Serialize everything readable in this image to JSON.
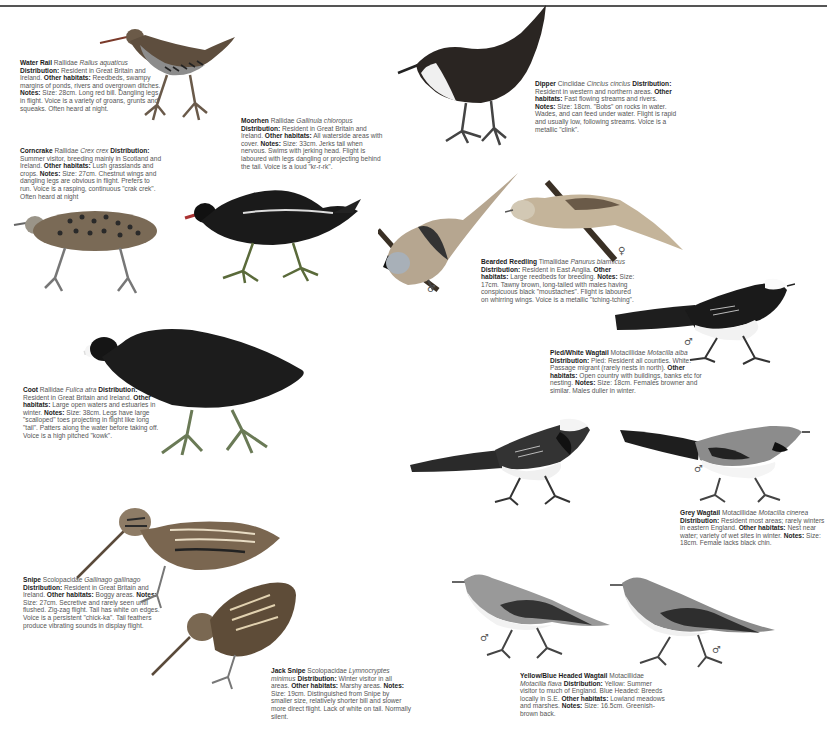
{
  "page": {
    "type": "field-guide-page",
    "topic": "Waterside birds"
  },
  "entries": [
    {
      "id": "water-rail",
      "name": "Water Rail",
      "family": "Rallidae",
      "latin": "Rallus aquaticus",
      "distribution": "Resident in Great Britain and Ireland.",
      "other_habitats": "Reedbeds, swampy margins of ponds, rivers and overgrown ditches.",
      "notes": "Size: 28cm. Long red bill. Dangling legs in flight. Voice is a variety of groans, grunts and squeaks. Often heard at night."
    },
    {
      "id": "corncrake",
      "name": "Corncrake",
      "family": "Rallidae",
      "latin": "Crex crex",
      "distribution": "Summer visitor, breeding mainly in Scotland and Ireland.",
      "other_habitats": "Lush grasslands and crops.",
      "notes": "Size: 27cm. Chestnut wings and dangling legs are obvious in flight. Prefers to run. Voice is a rasping, continuous \"crak crek\". Often heard at night"
    },
    {
      "id": "moorhen",
      "name": "Moorhen",
      "family": "Rallidae",
      "latin": "Gallinula chloropus",
      "distribution": "Resident in Great Britain and Ireland.",
      "other_habitats": "All waterside areas with cover.",
      "notes": "Size: 33cm. Jerks tail when nervous. Swims with jerking head. Flight is laboured with legs dangling or projecting behind the tail. Voice is a loud \"kr-r-rk\"."
    },
    {
      "id": "dipper",
      "name": "Dipper",
      "family": "Cinclidae",
      "latin": "Cinclus cinclus",
      "distribution": "Resident in western and northern areas.",
      "other_habitats": "Fast flowing streams and rivers.",
      "notes": "Size: 18cm. \"Bobs\" on rocks in water. Wades, and can feed under water. Flight is rapid and usually low, following streams. Voice is a metallic \"clink\"."
    },
    {
      "id": "bearded-reedling",
      "name": "Bearded Reedling",
      "family": "Timaliidae",
      "latin": "Panurus biarmicus",
      "distribution": "Resident in East Anglia.",
      "other_habitats": "Large reedbeds for breeding.",
      "notes": "Size: 17cm. Tawny brown, long-tailed with males having conspicuous black \"moustaches\". Flight is laboured on whirring wings. Voice is a metallic \"tching-tching\"."
    },
    {
      "id": "pied-white-wagtail",
      "name": "Pied/White Wagtail",
      "family": "Motacillidae",
      "latin": "Motacilla alba",
      "distribution": "Pied: Resident all counties. White: Passage migrant (rarely nests in north).",
      "other_habitats": "Open country with buildings, banks etc for nesting.",
      "notes": "Size: 18cm. Females browner and similar. Males duller in winter."
    },
    {
      "id": "coot",
      "name": "Coot",
      "family": "Rallidae",
      "latin": "Fulica atra",
      "distribution": "Resident in Great Britain and Ireland.",
      "other_habitats": "Large open waters and estuaries in winter.",
      "notes": "Size: 38cm. Legs have large \"scalloped\" toes projecting in flight like long \"tail\". Patters along the water before taking off. Voice is a high pitched \"kowk\"."
    },
    {
      "id": "grey-wagtail",
      "name": "Grey Wagtail",
      "family": "Motacillidae",
      "latin": "Motacilla cinerea",
      "distribution": "Resident most areas; rarely winters in eastern England.",
      "other_habitats": "Nest near water; variety of wet sites in winter.",
      "notes": "Size: 18cm. Female lacks black chin."
    },
    {
      "id": "snipe",
      "name": "Snipe",
      "family": "Scolopacidae",
      "latin": "Gallinago gallinago",
      "distribution": "Resident in Great Britain and Ireland.",
      "other_habitats": "Boggy areas.",
      "notes": "Size: 27cm. Secretive and rarely seen until flushed. Zig-zag flight. Tail has white on edges. Voice is a persistent \"chick-ka\". Tail feathers produce vibrating sounds in display flight."
    },
    {
      "id": "jack-snipe",
      "name": "Jack Snipe",
      "family": "Scolopacidae",
      "latin": "Lymnocryptes minimus",
      "distribution": "Winter visitor in all areas.",
      "other_habitats": "Marshy areas.",
      "notes": "Size: 19cm. Distinguished from Snipe by smaller size, relatively shorter bill and slower more direct flight. Lack of white on tail. Normally silent."
    },
    {
      "id": "yellow-blue-headed-wagtail",
      "name": "Yellow/Blue Headed Wagtail",
      "family": "Motacillidae",
      "latin": "Motacilla flava",
      "distribution": "Yellow: Summer visitor to much of England. Blue Headed: Breeds locally in S.E.",
      "other_habitats": "Lowland meadows and marshes.",
      "notes": "Size: 16.5cm. Greenish-brown back."
    }
  ],
  "labels": {
    "distribution": "Distribution:",
    "other_habitats": "Other habitats:",
    "notes": "Notes:"
  },
  "sex_symbols": {
    "male": "♂",
    "female": "♀"
  }
}
